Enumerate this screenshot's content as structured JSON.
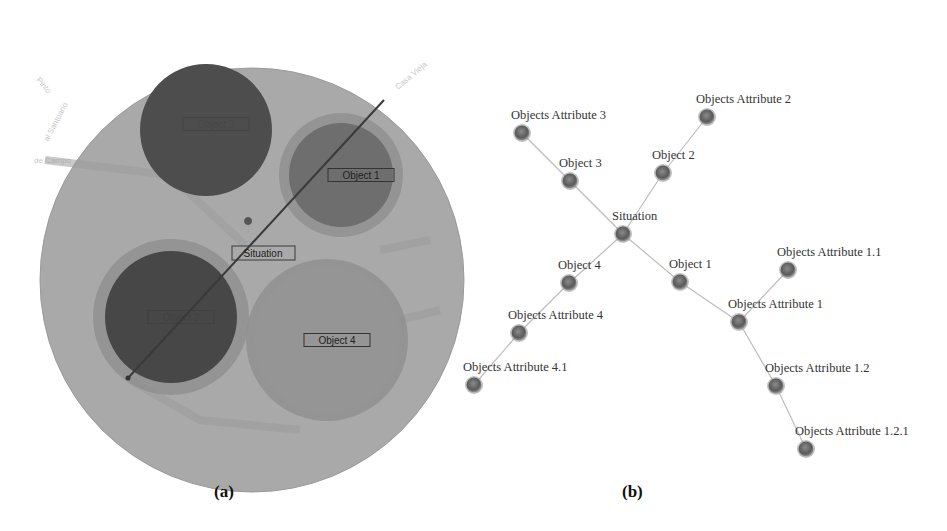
{
  "panel_a": {
    "caption": "(a)",
    "outer_circle": {
      "cx": 252,
      "cy": 280,
      "r": 212,
      "color": "#a9a9a9"
    },
    "objects": [
      {
        "id": "object_3",
        "label": "Object 3",
        "cx": 206,
        "cy": 130,
        "r": 66,
        "halo": 0,
        "fill": "#4d4d4d",
        "label_visible": false
      },
      {
        "id": "object_1",
        "label": "Object 1",
        "cx": 341,
        "cy": 175,
        "r": 52,
        "halo": 10,
        "fill": "#6e6e6e",
        "label_visible": true
      },
      {
        "id": "object_2",
        "label": "Object 2",
        "cx": 171,
        "cy": 317,
        "r": 66,
        "halo": 12,
        "fill": "#474747",
        "label_visible": false
      },
      {
        "id": "object_4",
        "label": "Object 4",
        "cx": 327,
        "cy": 340,
        "r": 73,
        "halo": 8,
        "fill": "#959595",
        "label_visible": true
      }
    ],
    "situation": {
      "label": "Situation",
      "x": 265,
      "y": 253
    },
    "map_labels": [
      "Payá",
      "al Santuario",
      "de Campo",
      "Casa Vieja",
      "Pinto",
      "Anitigo"
    ]
  },
  "panel_b": {
    "caption": "(b)",
    "nodes": [
      {
        "id": "situation",
        "label": "Situation",
        "x": 623,
        "y": 234
      },
      {
        "id": "object_3",
        "label": "Object 3",
        "x": 570,
        "y": 181
      },
      {
        "id": "attr_3",
        "label": "Objects Attribute 3",
        "x": 522,
        "y": 133
      },
      {
        "id": "object_2",
        "label": "Object 2",
        "x": 663,
        "y": 173
      },
      {
        "id": "attr_2",
        "label": "Objects Attribute 2",
        "x": 707,
        "y": 117
      },
      {
        "id": "object_4",
        "label": "Object 4",
        "x": 569,
        "y": 283
      },
      {
        "id": "attr_4",
        "label": "Objects Attribute 4",
        "x": 519,
        "y": 333
      },
      {
        "id": "attr_4_1",
        "label": "Objects Attribute 4.1",
        "x": 474,
        "y": 385
      },
      {
        "id": "object_1",
        "label": "Object 1",
        "x": 680,
        "y": 282
      },
      {
        "id": "attr_1",
        "label": "Objects Attribute 1",
        "x": 739,
        "y": 322
      },
      {
        "id": "attr_1_1",
        "label": "Objects Attribute 1.1",
        "x": 788,
        "y": 270
      },
      {
        "id": "attr_1_2",
        "label": "Objects Attribute 1.2",
        "x": 776,
        "y": 386
      },
      {
        "id": "attr_1_2_1",
        "label": "Objects Attribute 1.2.1",
        "x": 806,
        "y": 449
      }
    ],
    "edges": [
      [
        "situation",
        "object_3"
      ],
      [
        "object_3",
        "attr_3"
      ],
      [
        "situation",
        "object_2"
      ],
      [
        "object_2",
        "attr_2"
      ],
      [
        "situation",
        "object_4"
      ],
      [
        "object_4",
        "attr_4"
      ],
      [
        "attr_4",
        "attr_4_1"
      ],
      [
        "situation",
        "object_1"
      ],
      [
        "object_1",
        "attr_1"
      ],
      [
        "attr_1",
        "attr_1_1"
      ],
      [
        "attr_1",
        "attr_1_2"
      ],
      [
        "attr_1_2",
        "attr_1_2_1"
      ]
    ],
    "colors": {
      "edge": "#bdbdbd",
      "node": "#6a6a6a",
      "node_dark": "#4a4a4a",
      "node_halo": "#9a9a9a"
    }
  }
}
